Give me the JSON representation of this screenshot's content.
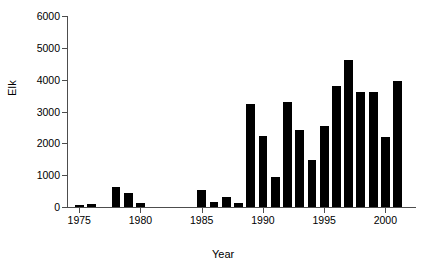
{
  "chart_data": {
    "type": "bar",
    "title": "",
    "xlabel": "Year",
    "ylabel": "Elk",
    "categories": [
      1975,
      1976,
      1977,
      1978,
      1979,
      1980,
      1981,
      1982,
      1983,
      1984,
      1985,
      1986,
      1987,
      1988,
      1989,
      1990,
      1991,
      1992,
      1993,
      1994,
      1995,
      1996,
      1997,
      1998,
      1999,
      2000,
      2001
    ],
    "values": [
      75,
      90,
      0,
      620,
      430,
      130,
      0,
      0,
      0,
      0,
      520,
      150,
      320,
      110,
      3250,
      2230,
      930,
      3300,
      2420,
      1490,
      2560,
      3800,
      4620,
      3600,
      3600,
      2200,
      3950
    ],
    "xlim": [
      1974,
      2002.5
    ],
    "ylim": [
      0,
      6000
    ],
    "yticks": [
      0,
      1000,
      2000,
      3000,
      4000,
      5000,
      6000
    ],
    "ytick_labels": [
      "0",
      "1000",
      "2000",
      "3000",
      "4000",
      "5000",
      "6000"
    ],
    "xticks": [
      1975,
      1980,
      1985,
      1990,
      1995,
      2000
    ],
    "xtick_labels": [
      "1975",
      "1980",
      "1985",
      "1990",
      "1995",
      "2000"
    ],
    "grid": false,
    "legend": null,
    "bar_color": "#000000",
    "axis_color": "#4d4d4d"
  }
}
